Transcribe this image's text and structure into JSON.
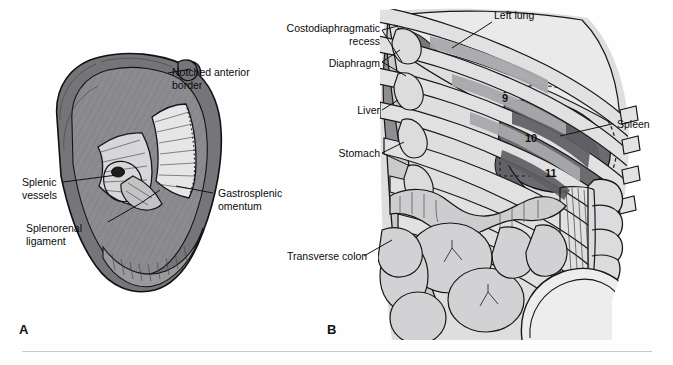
{
  "figure": {
    "panels": [
      {
        "id": "A",
        "letter": "A",
        "caption": "Visceral surface of the spleen"
      },
      {
        "id": "B",
        "letter": "B",
        "caption": "Relations of the spleen in situ"
      }
    ]
  },
  "panel_a": {
    "labels": [
      {
        "name": "notched-anterior-border",
        "text": "Notched anterior\nborder",
        "x": 172,
        "y": 66,
        "align": "left"
      },
      {
        "name": "splenic-vessels",
        "text": "Splenic\nvessels",
        "x": 22,
        "y": 176,
        "align": "left"
      },
      {
        "name": "gastrosplenic-omentum",
        "text": "Gastrosplenic\nomentum",
        "x": 218,
        "y": 187,
        "align": "left"
      },
      {
        "name": "splenorenal-ligament",
        "text": "Splenorenal\nligament",
        "x": 26,
        "y": 222,
        "align": "left"
      }
    ],
    "colors": {
      "capsule": "#767679",
      "parenchyma": "#8d8d90",
      "hilum_light": "#d8d8da",
      "omentum": "#e3e3e4",
      "outline": "#1b1b1b"
    }
  },
  "panel_b": {
    "labels": [
      {
        "name": "costodiaphragmatic-recess",
        "text": "Costodiaphragmatic\nrecess",
        "x": 274,
        "y": 22,
        "align": "right",
        "width": 106
      },
      {
        "name": "left-lung",
        "text": "Left lung",
        "x": 494,
        "y": 9,
        "align": "left"
      },
      {
        "name": "diaphragm",
        "text": "Diaphragm",
        "x": 316,
        "y": 57,
        "align": "right",
        "width": 64
      },
      {
        "name": "liver",
        "text": "Liver",
        "x": 342,
        "y": 104,
        "align": "right",
        "width": 38
      },
      {
        "name": "stomach",
        "text": "Stomach",
        "x": 323,
        "y": 147,
        "align": "right",
        "width": 57
      },
      {
        "name": "spleen",
        "text": "Spleen",
        "x": 617,
        "y": 118,
        "align": "left"
      },
      {
        "name": "transverse-colon",
        "text": "Transverse colon",
        "x": 287,
        "y": 250,
        "align": "left"
      }
    ],
    "rib_numbers": [
      {
        "name": "rib-9",
        "text": "9",
        "x": 502,
        "y": 92
      },
      {
        "name": "rib-10",
        "text": "10",
        "x": 525,
        "y": 132
      },
      {
        "name": "rib-11",
        "text": "11",
        "x": 545,
        "y": 167
      }
    ],
    "colors": {
      "rib": "#e0e0e1",
      "intercostal": "#b3b3b6",
      "lung": "#e9e9ea",
      "spleen": "#6f6f73",
      "spleen_dark": "#5f5f63",
      "stomach": "#c9c9cb",
      "liver": "#8f8f93",
      "bowel": "#cbcbcd",
      "vertebra": "#dcdcde",
      "kidney": "#ededee",
      "outline": "#1b1b1b",
      "dashed": "#1b1b1b"
    }
  }
}
